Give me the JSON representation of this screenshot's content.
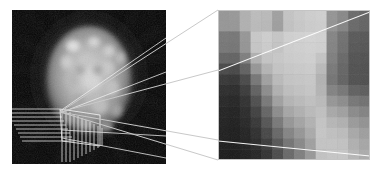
{
  "figure": {
    "background_color": "#ffffff",
    "width": 385,
    "height": 174
  },
  "left_panel": {
    "name": "brain-scan-panel",
    "label": "Reconstructed brain emission tomography slice",
    "x": 12,
    "y": 10,
    "width": 154,
    "height": 154,
    "background_color": "#000000",
    "overlay_color": "#f2f2f2",
    "roi_box": {
      "x": 48,
      "y": 102,
      "width": 38,
      "height": 34
    },
    "vertex": {
      "x": 48,
      "y": 102
    },
    "horizontal_rule_count": 9,
    "vertical_rule_count": 11,
    "cone_line_count": 4
  },
  "right_panel": {
    "name": "magnified-pixel-panel",
    "label": "Magnified pixel grid of region of interest",
    "x": 218,
    "y": 10,
    "width": 152,
    "height": 150,
    "border_color": "#bfbfbf",
    "overlay_line_color": "#ffffff",
    "grid_cols": 14,
    "grid_rows": 14,
    "top_line": {
      "x1": 0,
      "y1": 61,
      "x2": 152,
      "y2": 2
    },
    "bottom_line": {
      "x1": 0,
      "y1": 131,
      "x2": 152,
      "y2": 146
    }
  },
  "connectors": {
    "name": "zoom-cone-connectors",
    "color": "#c9c9c9",
    "lines": [
      {
        "x1": 60,
        "y1": 112,
        "x2": 218,
        "y2": 10
      },
      {
        "x1": 60,
        "y1": 112,
        "x2": 218,
        "y2": 70
      },
      {
        "x1": 60,
        "y1": 112,
        "x2": 218,
        "y2": 140
      },
      {
        "x1": 60,
        "y1": 112,
        "x2": 218,
        "y2": 160
      }
    ]
  },
  "chart_data": {
    "type": "heatmap",
    "xlabel": "",
    "ylabel": "",
    "colormap": "gray",
    "vmin": 0,
    "vmax": 255,
    "cols": 14,
    "rows": 14,
    "values": [
      [
        150,
        152,
        176,
        188,
        186,
        160,
        196,
        202,
        206,
        208,
        148,
        136,
        106,
        100
      ],
      [
        150,
        150,
        176,
        186,
        184,
        158,
        194,
        200,
        204,
        206,
        146,
        132,
        104,
        98
      ],
      [
        120,
        118,
        150,
        200,
        206,
        198,
        208,
        210,
        212,
        210,
        132,
        112,
        88,
        86
      ],
      [
        118,
        116,
        148,
        198,
        204,
        196,
        206,
        208,
        210,
        208,
        130,
        110,
        86,
        84
      ],
      [
        100,
        98,
        126,
        176,
        196,
        200,
        204,
        206,
        208,
        196,
        126,
        104,
        82,
        80
      ],
      [
        72,
        70,
        96,
        150,
        180,
        196,
        200,
        202,
        204,
        186,
        120,
        100,
        80,
        78
      ],
      [
        54,
        52,
        72,
        118,
        160,
        186,
        196,
        198,
        200,
        178,
        116,
        98,
        80,
        78
      ],
      [
        44,
        42,
        58,
        96,
        140,
        176,
        190,
        194,
        198,
        180,
        130,
        118,
        96,
        92
      ],
      [
        38,
        36,
        48,
        78,
        120,
        160,
        180,
        186,
        192,
        186,
        150,
        140,
        118,
        112
      ],
      [
        34,
        32,
        42,
        64,
        100,
        140,
        166,
        176,
        186,
        192,
        168,
        160,
        138,
        130
      ],
      [
        32,
        30,
        38,
        54,
        84,
        120,
        150,
        164,
        178,
        196,
        182,
        176,
        154,
        146
      ],
      [
        30,
        28,
        34,
        46,
        70,
        102,
        132,
        150,
        170,
        198,
        192,
        188,
        168,
        158
      ],
      [
        28,
        26,
        32,
        40,
        58,
        86,
        116,
        136,
        160,
        196,
        196,
        194,
        176,
        166
      ],
      [
        26,
        24,
        30,
        36,
        50,
        74,
        104,
        126,
        152,
        194,
        198,
        198,
        182,
        172
      ]
    ]
  }
}
